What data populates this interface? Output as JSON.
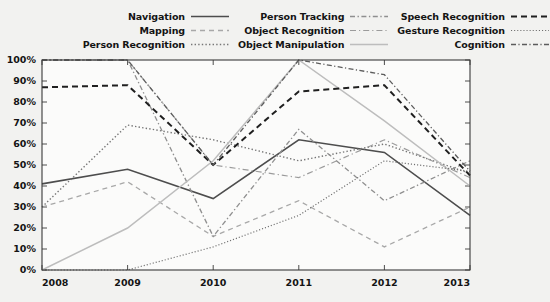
{
  "chart_data": {
    "type": "line",
    "title": "",
    "xlabel": "",
    "ylabel": "",
    "x": [
      "2008",
      "2009",
      "2010",
      "2011",
      "2012",
      "2013"
    ],
    "xlim": [
      2008,
      2013
    ],
    "ylim": [
      0,
      100
    ],
    "ytick_labels": [
      "0%",
      "10%",
      "20%",
      "30%",
      "40%",
      "50%",
      "60%",
      "70%",
      "80%",
      "90%",
      "100%"
    ],
    "ytick_values": [
      0,
      10,
      20,
      30,
      40,
      50,
      60,
      70,
      80,
      90,
      100
    ],
    "grid": false,
    "legend_position": "top",
    "legend_columns": 3,
    "series": [
      {
        "name": "Navigation",
        "style": "solid",
        "color": "#4d4d4d",
        "width": 1.6,
        "values": [
          41,
          48,
          34,
          62,
          56,
          26
        ]
      },
      {
        "name": "Mapping",
        "style": "dashed",
        "color": "#a8a8a8",
        "width": 1.3,
        "values": [
          30,
          42,
          16,
          33,
          11,
          30
        ]
      },
      {
        "name": "Person Recognition",
        "style": "dotted",
        "color": "#767676",
        "width": 1.4,
        "values": [
          30,
          69,
          62,
          52,
          60,
          46
        ]
      },
      {
        "name": "Person Tracking",
        "style": "dashdot",
        "color": "#8f8f8f",
        "width": 1.3,
        "values": [
          100,
          100,
          16,
          67,
          33,
          52
        ]
      },
      {
        "name": "Object Recognition",
        "style": "dashdotdot",
        "color": "#9b9b9b",
        "width": 1.2,
        "values": [
          100,
          100,
          50,
          44,
          62,
          44
        ]
      },
      {
        "name": "Object Manipulation",
        "style": "solid",
        "color": "#bdbdbd",
        "width": 1.5,
        "values": [
          0,
          20,
          52,
          100,
          71,
          40
        ]
      },
      {
        "name": "Speech Recognition",
        "style": "bolddash",
        "color": "#1f1f1f",
        "width": 2.0,
        "values": [
          87,
          88,
          50,
          85,
          88,
          45
        ]
      },
      {
        "name": "Gesture Recognition",
        "style": "finedot",
        "color": "#6e6e6e",
        "width": 1.2,
        "values": [
          0,
          0,
          11,
          26,
          52,
          47
        ]
      },
      {
        "name": "Cognition",
        "style": "dashdotdot2",
        "color": "#5c5c5c",
        "width": 1.3,
        "values": [
          100,
          100,
          50,
          100,
          93,
          47
        ]
      }
    ]
  },
  "legend": {
    "columns": [
      {
        "items": [
          {
            "label": "Navigation",
            "series_index": 0
          },
          {
            "label": "Mapping",
            "series_index": 1
          },
          {
            "label": "Person Recognition",
            "series_index": 2
          }
        ]
      },
      {
        "items": [
          {
            "label": "Person Tracking",
            "series_index": 3
          },
          {
            "label": "Object Recognition",
            "series_index": 4
          },
          {
            "label": "Object Manipulation",
            "series_index": 5
          }
        ]
      },
      {
        "items": [
          {
            "label": "Speech Recognition",
            "series_index": 6
          },
          {
            "label": "Gesture Recognition",
            "series_index": 7
          },
          {
            "label": "Cognition",
            "series_index": 8
          }
        ]
      }
    ]
  },
  "axes": {
    "y_labels": [
      "100%",
      "90%",
      "80%",
      "70%",
      "60%",
      "50%",
      "40%",
      "30%",
      "20%",
      "10%",
      "0%"
    ],
    "x_labels": [
      "2008",
      "2009",
      "2010",
      "2011",
      "2012",
      "2013"
    ]
  },
  "colors": {
    "background": "#f2f2f0",
    "plot_background": "#fbfbfa",
    "axis": "#3a3a3a",
    "text": "#141414"
  }
}
